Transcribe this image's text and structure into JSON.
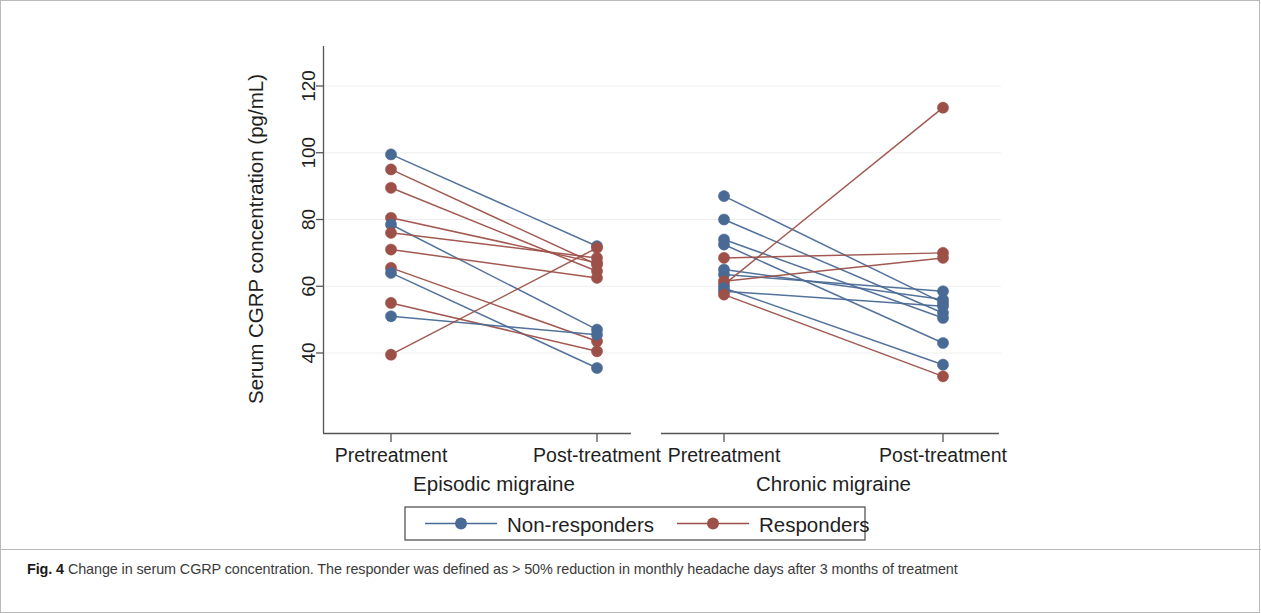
{
  "figure": {
    "caption_label": "Fig. 4",
    "caption_body": "Change in serum CGRP concentration. The responder was defined as > 50% reduction in monthly headache days after 3 months of treatment"
  },
  "colors": {
    "non_responder": "#4a6a96",
    "responder": "#9c5048",
    "axis": "#555555",
    "grid": "#efefef",
    "text": "#1f1f1f",
    "frame": "#b9b9b9"
  },
  "chart_data": {
    "type": "line",
    "title": "",
    "subtitle": "",
    "xlabel": "",
    "ylabel": "Serum CGRP concentration (pg/mL)",
    "ylim": [
      26,
      128
    ],
    "yticks": [
      40,
      60,
      80,
      100,
      120
    ],
    "ytick_labels": [
      "40",
      "60",
      "80",
      "100",
      "120"
    ],
    "grid": true,
    "grid_axis": "y",
    "legend": {
      "position": "bottom-center",
      "entries": [
        {
          "label": "Non-responders",
          "color": "#4a6a96",
          "marker": "circle"
        },
        {
          "label": "Responders",
          "color": "#9c5048",
          "marker": "circle"
        }
      ]
    },
    "panels": [
      {
        "name": "Episodic migraine",
        "group_label": "Episodic migraine",
        "x_categories": [
          "Pretreatment",
          "Post-treatment"
        ],
        "series": [
          {
            "group": "Non-responders",
            "values": [
              99.5,
              72.0
            ]
          },
          {
            "group": "Responders",
            "values": [
              95.0,
              66.5
            ]
          },
          {
            "group": "Responders",
            "values": [
              89.5,
              64.5
            ]
          },
          {
            "group": "Responders",
            "values": [
              80.5,
              67.0
            ]
          },
          {
            "group": "Non-responders",
            "values": [
              78.5,
              47.0
            ]
          },
          {
            "group": "Responders",
            "values": [
              76.0,
              68.5
            ]
          },
          {
            "group": "Responders",
            "values": [
              71.0,
              62.5
            ]
          },
          {
            "group": "Responders",
            "values": [
              65.5,
              43.5
            ]
          },
          {
            "group": "Non-responders",
            "values": [
              64.0,
              35.5
            ]
          },
          {
            "group": "Responders",
            "values": [
              55.0,
              40.5
            ]
          },
          {
            "group": "Non-responders",
            "values": [
              51.0,
              45.5
            ]
          },
          {
            "group": "Responders",
            "values": [
              39.5,
              71.5
            ]
          }
        ]
      },
      {
        "name": "Chronic migraine",
        "group_label": "Chronic migraine",
        "x_categories": [
          "Pretreatment",
          "Post-treatment"
        ],
        "series": [
          {
            "group": "Non-responders",
            "values": [
              87.0,
              55.0
            ]
          },
          {
            "group": "Non-responders",
            "values": [
              80.0,
              52.0
            ]
          },
          {
            "group": "Non-responders",
            "values": [
              74.0,
              50.5
            ]
          },
          {
            "group": "Non-responders",
            "values": [
              72.5,
              43.0
            ]
          },
          {
            "group": "Responders",
            "values": [
              68.5,
              70.0
            ]
          },
          {
            "group": "Non-responders",
            "values": [
              65.0,
              56.0
            ]
          },
          {
            "group": "Non-responders",
            "values": [
              63.5,
              58.5
            ]
          },
          {
            "group": "Responders",
            "values": [
              61.5,
              68.5
            ]
          },
          {
            "group": "Responders",
            "values": [
              60.5,
              113.5
            ]
          },
          {
            "group": "Non-responders",
            "values": [
              59.5,
              36.5
            ]
          },
          {
            "group": "Non-responders",
            "values": [
              58.5,
              54.0
            ]
          },
          {
            "group": "Responders",
            "values": [
              57.5,
              33.0
            ]
          }
        ]
      }
    ]
  }
}
